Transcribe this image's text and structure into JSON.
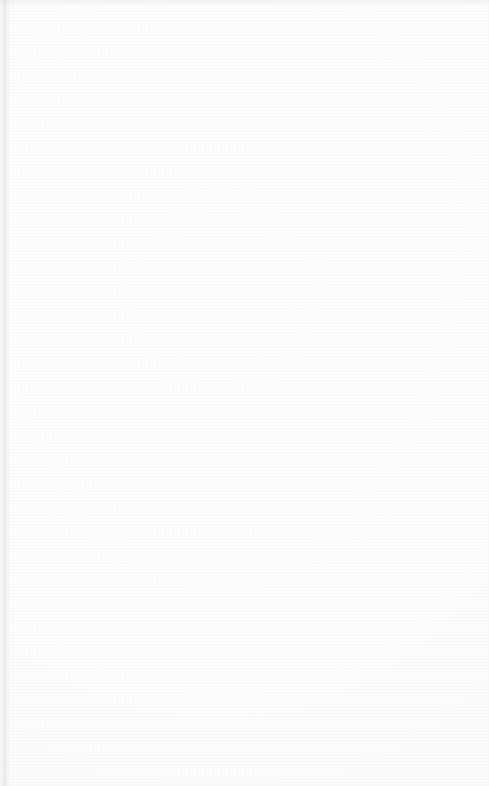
{
  "document": {
    "kind": "scanned-blank-ruled-notebook-page",
    "page_width": 489,
    "page_height": 786,
    "paper_color": "#fefefe",
    "has_text": false,
    "has_handwriting": false,
    "text_content": "",
    "margin_rule_visible": false,
    "header_text": "",
    "footer_text": ""
  },
  "ruling": {
    "line_color": "#b2b7bc",
    "line_thickness_px": 1,
    "line_spacing_px": 23.5,
    "line_count": 31,
    "first_line_y": 47,
    "last_line_y": 766,
    "left_x": 0,
    "right_x": 483,
    "skew_degrees": -0.62,
    "line_y_positions": [
      47,
      70.5,
      94,
      117.5,
      141,
      164.5,
      188,
      211.5,
      235,
      258.5,
      282,
      305.5,
      329,
      352.5,
      376,
      399.5,
      423,
      446.5,
      470,
      493.5,
      517,
      540.5,
      564,
      587.5,
      611,
      634.5,
      658,
      681.5,
      705,
      728.5,
      766
    ],
    "line_opacities": [
      0.92,
      0.88,
      0.95,
      0.9,
      0.93,
      0.86,
      0.94,
      0.89,
      0.95,
      0.87,
      0.93,
      0.91,
      0.96,
      0.88,
      0.94,
      0.9,
      0.95,
      0.89,
      0.93,
      0.92,
      0.96,
      0.87,
      0.94,
      0.9,
      0.95,
      0.88,
      0.93,
      0.91,
      0.95,
      0.89,
      0.9
    ]
  },
  "artifacts": {
    "page_edge_shadow": {
      "x": 461,
      "width": 10,
      "color": "#bec2c8"
    },
    "bottom_smudge": {
      "y": 771,
      "height": 15,
      "color": "#b0b4ba"
    },
    "top_smudge": {
      "height": 7,
      "color": "#c4c8ce"
    }
  }
}
